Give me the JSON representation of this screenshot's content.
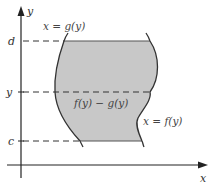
{
  "diagram": {
    "type": "area-between-curves",
    "axes": {
      "x_label": "x",
      "y_label": "y"
    },
    "ticks": {
      "d": "d",
      "y": "y",
      "c": "c"
    },
    "curves": {
      "left_label": "x = g(y)",
      "right_label": "x = f(y)"
    },
    "strip_label": "f(y) − g(y)",
    "colors": {
      "region_fill": "#c8c8c8",
      "curve_stroke": "#333333",
      "axis_stroke": "#222222",
      "dash_stroke": "#333333"
    }
  }
}
